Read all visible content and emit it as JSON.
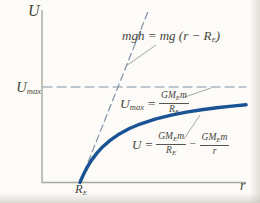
{
  "figure": {
    "y_axis_label": "U",
    "x_axis_label": "r",
    "umax_tick": {
      "base": "U",
      "sub": "max"
    },
    "re_tick": {
      "base": "R",
      "sub": "E"
    },
    "tangent_label": {
      "p1": "mgh = mg (r − R",
      "sub": "E",
      "p2": ")"
    },
    "umax_eq": {
      "lhs_base": "U",
      "lhs_sub": "max",
      "eq": "=",
      "num_main": "GM",
      "num_sub": "E",
      "num_tail": "m",
      "den_base": "R",
      "den_sub": "E"
    },
    "curve_eq": {
      "lhs": "U",
      "eq": "=",
      "f1": {
        "num_main": "GM",
        "num_sub": "E",
        "num_tail": "m",
        "den_base": "R",
        "den_sub": "E"
      },
      "minus": "−",
      "f2": {
        "num_main": "GM",
        "num_sub": "E",
        "num_tail": "m",
        "den": "r"
      }
    },
    "colors": {
      "curve": "#1a5394",
      "dashed_lines": "#7e93a9",
      "axes": "#a6a89e",
      "text": "#474740",
      "leader_lines": "#90908a",
      "background": "#fcfbf7"
    }
  },
  "chart_data": {
    "type": "line",
    "xlabel": "r",
    "ylabel": "U",
    "x_units": "multiples of Earth radius R_E",
    "y_units": "multiples of U_max = GM_E m / R_E",
    "xlim": [
      0,
      5.37
    ],
    "ylim": [
      0,
      1.85
    ],
    "grid": false,
    "annotations": [
      "mgh = mg (r − R_E)",
      "U_max = GM_E m / R_E",
      "U = GM_E m / R_E − GM_E m / r",
      "R_E marked on x-axis where curve meets U = 0"
    ],
    "pixel_mapping": {
      "origin": [
        42,
        182.5
      ],
      "r_unit_px": 38,
      "u_unit_px": 95.5
    },
    "series": [
      {
        "name": "umax-asymptote",
        "label": "U_max horizontal dashed asymptote",
        "r": [
          0.03,
          5.37
        ],
        "u": [
          1,
          1
        ],
        "style": {
          "stroke": "#7e93a9",
          "width": 1.1,
          "dash": "9 5"
        }
      },
      {
        "name": "mgh-tangent-line",
        "label": "mgh = mg (r − R_E) straight dashed line",
        "r": [
          1.0,
          2.78
        ],
        "u": [
          0,
          1.78
        ],
        "style": {
          "stroke": "#7e93a9",
          "width": 1.2,
          "dash": "7 4"
        }
      },
      {
        "name": "potential-energy-curve",
        "label": "U = GM_E m/R_E − GM_E m/r",
        "r": [
          1.0,
          1.03,
          1.07,
          1.12,
          1.2,
          1.3,
          1.45,
          1.6,
          1.8,
          2.0,
          2.3,
          2.6,
          3.0,
          3.4,
          3.8,
          4.2,
          4.6,
          5.0,
          5.37
        ],
        "u": [
          0,
          0.029,
          0.065,
          0.107,
          0.167,
          0.231,
          0.31,
          0.375,
          0.444,
          0.5,
          0.565,
          0.615,
          0.667,
          0.706,
          0.737,
          0.762,
          0.783,
          0.8,
          0.814
        ],
        "style": {
          "stroke": "#1a5394",
          "width": 3.4,
          "dash": null
        }
      }
    ]
  }
}
